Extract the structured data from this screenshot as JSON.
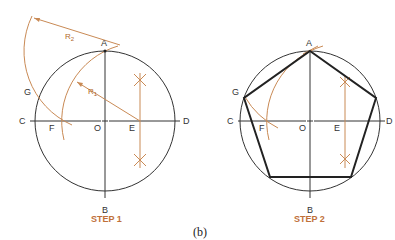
{
  "figure_label": "(b)",
  "colors": {
    "construction": "#c98a55",
    "outline": "#333333",
    "polygon": "#222222",
    "step_label": "#c0703a"
  },
  "step1": {
    "title": "STEP 1",
    "points": {
      "A": "A",
      "B": "B",
      "C": "C",
      "D": "D",
      "E": "E",
      "F": "F",
      "G": "G",
      "O": "O"
    },
    "radii": {
      "r1": "R",
      "r1_sub": "1",
      "r2": "R",
      "r2_sub": "2"
    }
  },
  "step2": {
    "title": "STEP 2",
    "points": {
      "A": "A",
      "B": "B",
      "C": "C",
      "D": "D",
      "E": "E",
      "F": "F",
      "G": "G",
      "O": "O"
    }
  }
}
